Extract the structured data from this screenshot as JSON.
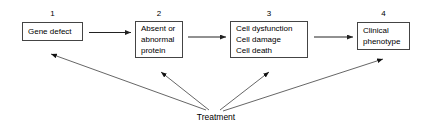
{
  "diagram": {
    "type": "flowchart",
    "title": "",
    "colors": {
      "background": "#ffffff",
      "box_border": "#444444",
      "arrow": "#333333",
      "text": "#000000"
    },
    "nodes": [
      {
        "number": "1",
        "lines": [
          "Gene defect"
        ]
      },
      {
        "number": "2",
        "lines": [
          "Absent or",
          "abnormal",
          "protein"
        ]
      },
      {
        "number": "3",
        "lines": [
          "Cell dysfunction",
          "Cell damage",
          "Cell death"
        ]
      },
      {
        "number": "4",
        "lines": [
          "Clinical",
          "phenotype"
        ]
      }
    ],
    "intervention": {
      "label": "Treatment",
      "targets": [
        "1",
        "2",
        "3",
        "4"
      ]
    },
    "sequence_arrows": [
      {
        "from": "1",
        "to": "2"
      },
      {
        "from": "2",
        "to": "3"
      },
      {
        "from": "3",
        "to": "4"
      }
    ]
  }
}
